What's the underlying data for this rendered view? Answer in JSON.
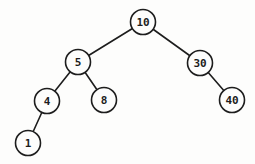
{
  "diagram": {
    "type": "binary-tree",
    "canvas": {
      "width": 255,
      "height": 164,
      "background": "#fdfdfc"
    },
    "style": {
      "stroke_color": "#1d1d1d",
      "node_fill": "#fdfdfc",
      "text_color": "#1d1d1d",
      "stroke_width": 1.6,
      "node_radius": 12.5,
      "font_size": 11
    },
    "nodes": [
      {
        "id": "10",
        "label": "10",
        "x": 143,
        "y": 22,
        "parent": null,
        "side": "root"
      },
      {
        "id": "5",
        "label": "5",
        "x": 78,
        "y": 62,
        "parent": "10",
        "side": "left"
      },
      {
        "id": "30",
        "label": "30",
        "x": 200,
        "y": 63,
        "parent": "10",
        "side": "right"
      },
      {
        "id": "4",
        "label": "4",
        "x": 47,
        "y": 101,
        "parent": "5",
        "side": "left"
      },
      {
        "id": "8",
        "label": "8",
        "x": 104,
        "y": 100,
        "parent": "5",
        "side": "right"
      },
      {
        "id": "40",
        "label": "40",
        "x": 232,
        "y": 100,
        "parent": "30",
        "side": "right"
      },
      {
        "id": "1",
        "label": "1",
        "x": 28,
        "y": 143,
        "parent": "4",
        "side": "left"
      }
    ],
    "edges": [
      {
        "from": "10",
        "to": "5"
      },
      {
        "from": "10",
        "to": "30"
      },
      {
        "from": "5",
        "to": "4"
      },
      {
        "from": "5",
        "to": "8"
      },
      {
        "from": "30",
        "to": "40"
      },
      {
        "from": "4",
        "to": "1"
      }
    ]
  }
}
